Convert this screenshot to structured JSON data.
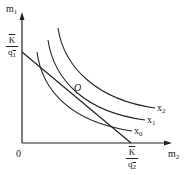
{
  "diagram": {
    "type": "indifference-curves-with-budget-line",
    "axes": {
      "y_label": "m",
      "y_label_sub": "1",
      "x_label": "m",
      "x_label_sub": "2",
      "origin_label": "0"
    },
    "y_intercept": {
      "numerator": "K",
      "denominator": "q",
      "denominator_sub": "1"
    },
    "x_intercept": {
      "numerator": "K",
      "denominator": "q",
      "denominator_sub": "2"
    },
    "curves": [
      {
        "label": "x",
        "sub": "0"
      },
      {
        "label": "x",
        "sub": "1"
      },
      {
        "label": "x",
        "sub": "2"
      }
    ],
    "tangent_point_label": "O",
    "colors": {
      "line": "#222222",
      "background": "#ffffff"
    }
  }
}
